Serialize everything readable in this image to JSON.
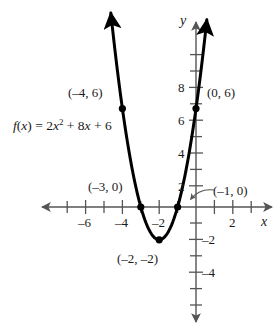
{
  "figure": {
    "kind": "cartesian-graph",
    "width": 278,
    "height": 332,
    "background": "#ffffff",
    "stroke_color": "#000000",
    "axis_color": "#555555",
    "curve_color": "#000000"
  },
  "axes": {
    "x_axis_name": "x",
    "y_axis_name": "y",
    "origin_px": {
      "x": 196,
      "y": 207
    },
    "x_unit_px": 18.4,
    "y_unit_px": 16.4,
    "x_ticks_labeled": [
      "-6",
      "-4",
      "-2",
      "2"
    ],
    "y_ticks_labeled": [
      "8",
      "6",
      "4",
      "2",
      "-2",
      "-4"
    ],
    "x_tick_values": [
      -6,
      -4,
      -2,
      2
    ],
    "y_tick_values": [
      8,
      6,
      4,
      2,
      -2,
      -4
    ],
    "x_range": [
      -7.8,
      4.0
    ],
    "y_range": [
      -7.0,
      9.0
    ],
    "grid": false,
    "arrowheads": [
      "x-left",
      "x-right",
      "y-up",
      "y-down"
    ]
  },
  "function_label": {
    "prefix": "f",
    "open": "(",
    "var": "x",
    "close": ")",
    "equals": " = 2",
    "var2": "x",
    "exponent": "2",
    "rest": " + 8",
    "var3": "x",
    "tail": " + 6",
    "plain": "f(x) = 2x² + 8x + 6"
  },
  "points": [
    {
      "id": "left-symmetric-point",
      "label": "(–4, 6)",
      "x": -4,
      "y": 6,
      "marker": "filled-dot",
      "label_position": "left"
    },
    {
      "id": "y-intercept",
      "label": "(0, 6)",
      "x": 0,
      "y": 6,
      "marker": "filled-dot",
      "label_position": "right"
    },
    {
      "id": "x-intercept-left",
      "label": "(–3, 0)",
      "x": -3,
      "y": 0,
      "marker": "filled-dot",
      "label_position": "above-left"
    },
    {
      "id": "x-intercept-right",
      "label": "(–1, 0)",
      "x": -1,
      "y": 0,
      "marker": "filled-dot",
      "label_position": "right-with-arrow"
    },
    {
      "id": "vertex",
      "label": "(–2, –2)",
      "x": -2,
      "y": -2,
      "marker": "filled-dot",
      "label_position": "below-left"
    }
  ],
  "annotations": {
    "leader_arrow": {
      "from_label": "(–1, 0)",
      "to_point": "x-intercept-right",
      "style": "curved-arrow"
    }
  },
  "chart_data": {
    "type": "line",
    "title": "",
    "subtitle": "",
    "xlabel": "x",
    "ylabel": "y",
    "grid": false,
    "legend": "none",
    "xlim": [
      -7.8,
      4.0
    ],
    "ylim": [
      -7.0,
      9.0
    ],
    "xticks": [
      -6,
      -4,
      -2,
      2
    ],
    "yticks": [
      8,
      6,
      4,
      2,
      -2,
      -4
    ],
    "series": [
      {
        "name": "f(x) = 2x² + 8x + 6",
        "equation": "f(x) = 2x^2 + 8x + 6",
        "coefficients": {
          "a": 2,
          "b": 8,
          "c": 6
        },
        "vertex": [
          -2,
          -2
        ],
        "roots": [
          -3,
          -1
        ],
        "y_intercept": [
          0,
          6
        ],
        "x": [
          -4.6,
          -4.4,
          -4.2,
          -4.0,
          -3.8,
          -3.6,
          -3.4,
          -3.2,
          -3.0,
          -2.8,
          -2.6,
          -2.4,
          -2.2,
          -2.0,
          -1.8,
          -1.6,
          -1.4,
          -1.2,
          -1.0,
          -0.8,
          -0.6,
          -0.4,
          -0.2,
          0.0,
          0.2,
          0.4,
          0.6
        ],
        "values": [
          11.52,
          9.52,
          7.68,
          6.0,
          4.48,
          3.12,
          1.92,
          0.88,
          0.0,
          -0.72,
          -1.28,
          -1.68,
          -1.92,
          -2.0,
          -1.92,
          -1.68,
          -1.28,
          -0.72,
          0.0,
          0.88,
          1.92,
          3.12,
          4.48,
          6.0,
          7.68,
          9.52,
          11.52
        ]
      }
    ],
    "annotated_points": [
      {
        "label": "(–4, 6)",
        "x": -4,
        "y": 6
      },
      {
        "label": "(0, 6)",
        "x": 0,
        "y": 6
      },
      {
        "label": "(–3, 0)",
        "x": -3,
        "y": 0
      },
      {
        "label": "(–1, 0)",
        "x": -1,
        "y": 0
      },
      {
        "label": "(–2, –2)",
        "x": -2,
        "y": -2
      }
    ]
  },
  "tick_labels": {
    "x_neg6": "–6",
    "x_neg4": "–4",
    "x_neg2": "–2",
    "x_pos2": "2",
    "y_8": "8",
    "y_6": "6",
    "y_4": "4",
    "y_2": "2",
    "y_neg2": "–2",
    "y_neg4": "–4"
  },
  "labels": {
    "pt_neg4_6": "(–4, 6)",
    "pt_0_6": "(0, 6)",
    "pt_neg3_0": "(–3, 0)",
    "pt_neg1_0": "(–1, 0)",
    "pt_vertex": "(–2, –2)",
    "axis_x": "x",
    "axis_y": "y"
  }
}
